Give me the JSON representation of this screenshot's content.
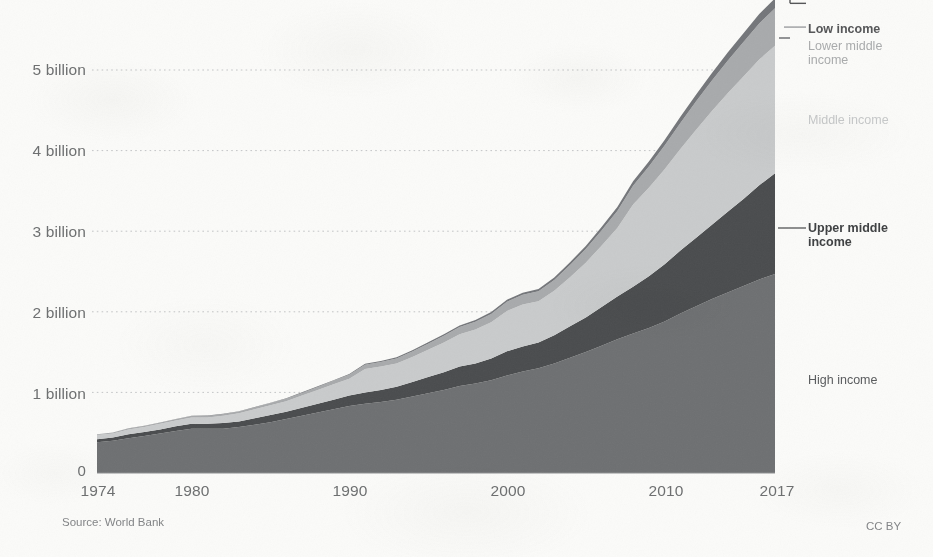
{
  "chart_data": {
    "type": "area",
    "stacked": true,
    "title": "",
    "subtitle": "",
    "xlabel": "",
    "ylabel": "",
    "xlim": [
      1974,
      2017
    ],
    "ylim": [
      0,
      5.4
    ],
    "grid": true,
    "legend_position": "right",
    "y_unit": "billion",
    "y_tick_labels": [
      "0",
      "1 billion",
      "2 billion",
      "3 billion",
      "4 billion",
      "5 billion"
    ],
    "y_tick_values": [
      0,
      1,
      2,
      3,
      4,
      5
    ],
    "x_tick_labels": [
      "1974",
      "1980",
      "1990",
      "2000",
      "2010",
      "2017"
    ],
    "x_tick_values": [
      1974,
      1980,
      1990,
      2000,
      2010,
      2017
    ],
    "x": [
      1974,
      1975,
      1976,
      1977,
      1978,
      1979,
      1980,
      1981,
      1982,
      1983,
      1984,
      1985,
      1986,
      1987,
      1988,
      1989,
      1990,
      1991,
      1992,
      1993,
      1994,
      1995,
      1996,
      1997,
      1998,
      1999,
      2000,
      2001,
      2002,
      2003,
      2004,
      2005,
      2006,
      2007,
      2008,
      2009,
      2010,
      2011,
      2012,
      2013,
      2014,
      2015,
      2016,
      2017
    ],
    "series": [
      {
        "name": "High income",
        "color": "#6e7072",
        "values": [
          0.38,
          0.4,
          0.43,
          0.46,
          0.49,
          0.52,
          0.55,
          0.55,
          0.55,
          0.57,
          0.6,
          0.63,
          0.67,
          0.71,
          0.75,
          0.79,
          0.83,
          0.86,
          0.88,
          0.91,
          0.95,
          0.99,
          1.03,
          1.08,
          1.11,
          1.15,
          1.21,
          1.26,
          1.3,
          1.36,
          1.43,
          1.5,
          1.58,
          1.66,
          1.73,
          1.8,
          1.88,
          1.98,
          2.07,
          2.16,
          2.24,
          2.32,
          2.4,
          2.47
        ]
      },
      {
        "name": "Upper middle income",
        "color": "#4a4c4e",
        "values": [
          0.04,
          0.04,
          0.05,
          0.05,
          0.05,
          0.06,
          0.06,
          0.06,
          0.07,
          0.07,
          0.08,
          0.09,
          0.09,
          0.1,
          0.11,
          0.12,
          0.13,
          0.14,
          0.15,
          0.16,
          0.18,
          0.2,
          0.22,
          0.24,
          0.25,
          0.27,
          0.3,
          0.31,
          0.32,
          0.35,
          0.39,
          0.43,
          0.48,
          0.53,
          0.58,
          0.64,
          0.71,
          0.78,
          0.85,
          0.92,
          1.0,
          1.08,
          1.17,
          1.25
        ]
      },
      {
        "name": "Middle income",
        "color": "#c9cbcc",
        "values": [
          0.05,
          0.05,
          0.06,
          0.06,
          0.07,
          0.07,
          0.08,
          0.08,
          0.09,
          0.1,
          0.11,
          0.12,
          0.13,
          0.15,
          0.17,
          0.19,
          0.21,
          0.29,
          0.29,
          0.29,
          0.31,
          0.34,
          0.37,
          0.4,
          0.42,
          0.45,
          0.5,
          0.52,
          0.51,
          0.55,
          0.61,
          0.68,
          0.76,
          0.85,
          1.02,
          1.1,
          1.18,
          1.26,
          1.34,
          1.41,
          1.47,
          1.52,
          1.56,
          1.58
        ]
      },
      {
        "name": "Lower middle income",
        "color": "#a8aaac",
        "values": [
          0.01,
          0.011,
          0.012,
          0.013,
          0.014,
          0.016,
          0.017,
          0.018,
          0.02,
          0.022,
          0.024,
          0.027,
          0.03,
          0.034,
          0.038,
          0.043,
          0.048,
          0.054,
          0.058,
          0.062,
          0.068,
          0.075,
          0.082,
          0.09,
          0.096,
          0.104,
          0.115,
          0.12,
          0.124,
          0.135,
          0.15,
          0.168,
          0.188,
          0.21,
          0.235,
          0.262,
          0.292,
          0.322,
          0.352,
          0.38,
          0.405,
          0.428,
          0.448,
          0.465
        ]
      },
      {
        "name": "Low income",
        "color": "#74767a",
        "values": [
          0.002,
          0.002,
          0.002,
          0.003,
          0.003,
          0.003,
          0.004,
          0.004,
          0.004,
          0.005,
          0.005,
          0.006,
          0.006,
          0.007,
          0.008,
          0.009,
          0.01,
          0.011,
          0.012,
          0.013,
          0.015,
          0.016,
          0.018,
          0.02,
          0.021,
          0.023,
          0.026,
          0.027,
          0.028,
          0.031,
          0.035,
          0.039,
          0.044,
          0.049,
          0.055,
          0.062,
          0.069,
          0.077,
          0.085,
          0.093,
          0.101,
          0.109,
          0.117,
          0.124
        ]
      }
    ]
  },
  "legend": {
    "low_income": "Low income",
    "lower_middle_income": "Lower middle\nincome",
    "lower_middle_income_line1": "Lower middle",
    "lower_middle_income_line2": "income",
    "middle_income": "Middle income",
    "upper_middle_income_line1": "Upper middle",
    "upper_middle_income_line2": "income",
    "high_income": "High income"
  },
  "footer": {
    "source": "Source: World Bank",
    "license": "CC BY"
  },
  "colors": {
    "high_income": "#6e7072",
    "upper_middle_income": "#4a4c4e",
    "middle_income": "#c9cbcc",
    "lower_middle_income": "#a8aaac",
    "low_income": "#74767a",
    "background": "#fbfbf9",
    "gridline": "#b9bbbd",
    "axis_text": "#6d6f70"
  }
}
